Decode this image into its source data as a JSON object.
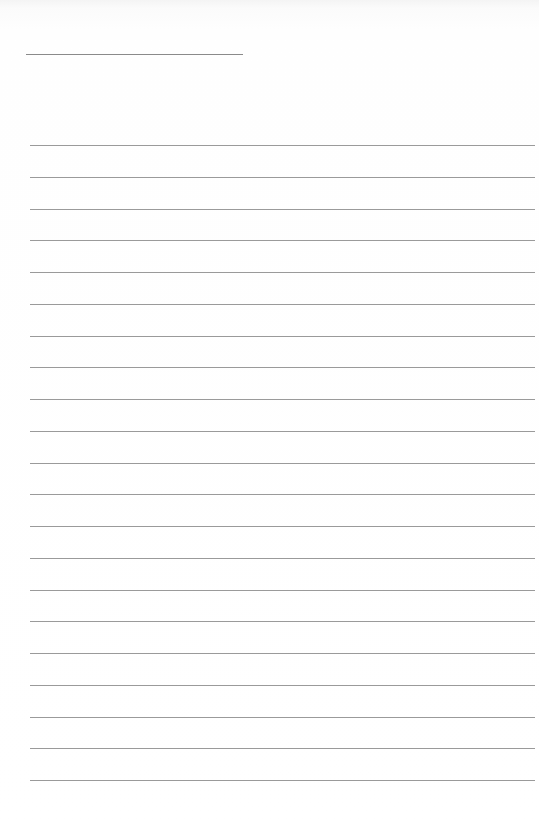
{
  "page": {
    "type": "lined-paper",
    "background_color": "#ffffff",
    "line_color": "#9a9a9a"
  },
  "title_line": {
    "visible": true,
    "text": ""
  },
  "rules": {
    "count": 21,
    "first_y": 145,
    "spacing": 31.75,
    "lines": [
      "",
      "",
      "",
      "",
      "",
      "",
      "",
      "",
      "",
      "",
      "",
      "",
      "",
      "",
      "",
      "",
      "",
      "",
      "",
      "",
      ""
    ]
  }
}
